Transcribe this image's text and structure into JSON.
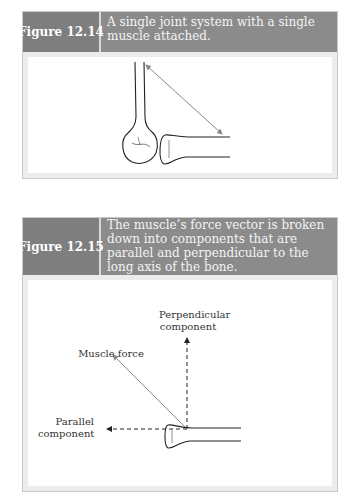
{
  "figures": [
    {
      "label": "Figure 12.14",
      "caption": "A single joint system with a single muscle attached."
    },
    {
      "label": "Figure 12.15",
      "caption": "The muscle’s force vector is broken down into components that are parallel and perpendicular to the long axis of the bone.",
      "annotations": {
        "perpendicular_line1": "Perpendicular",
        "perpendicular_line2": "component",
        "muscle_force": "Muscle force",
        "parallel_line1": "Parallel",
        "parallel_line2": "component"
      }
    }
  ],
  "colors": {
    "header_bg": "#8b8b8b",
    "label_bg": "#7e7e7e",
    "panel_frame": "#ececec",
    "vector_gray": "#8a8a8a"
  }
}
